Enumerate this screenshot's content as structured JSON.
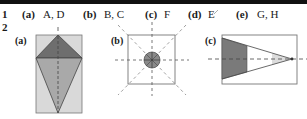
{
  "rows": {
    "row1_number": "1",
    "row2_number": "2"
  },
  "answers": [
    {
      "label": "(a)",
      "value": "A, D"
    },
    {
      "label": "(b)",
      "value": "B, C"
    },
    {
      "label": "(c)",
      "value": "F"
    },
    {
      "label": "(d)",
      "value": "E"
    },
    {
      "label": "(e)",
      "value": "G, H"
    }
  ],
  "panels": [
    {
      "label": "(a)",
      "shape": "kite-in-rectangle-with-vertical-axis"
    },
    {
      "label": "(b)",
      "shape": "square-with-circle-and-four-symmetry-axes"
    },
    {
      "label": "(c)",
      "shape": "triangle-in-rectangle-with-horizontal-axis"
    }
  ],
  "colors": {
    "dark_fill": "#6e6e6e",
    "mid_fill": "#a9a9a9",
    "light_fill": "#d9d9d9",
    "line": "#555555",
    "topbar": "#111111"
  }
}
